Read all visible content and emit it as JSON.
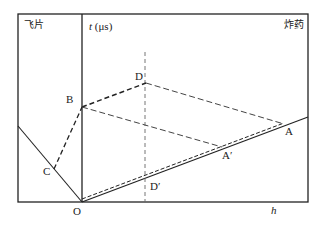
{
  "regions": {
    "left_label": "飞片",
    "right_label": "炸药"
  },
  "axes": {
    "y_label_var": "t",
    "y_label_unit": "(μs)",
    "x_label": "h",
    "origin": "O"
  },
  "points": {
    "A": "A",
    "A_prime": "A′",
    "B": "B",
    "C": "C",
    "D": "D",
    "D_prime": "D′"
  },
  "colors": {
    "line": "#222222",
    "dashed_light": "#555555"
  }
}
